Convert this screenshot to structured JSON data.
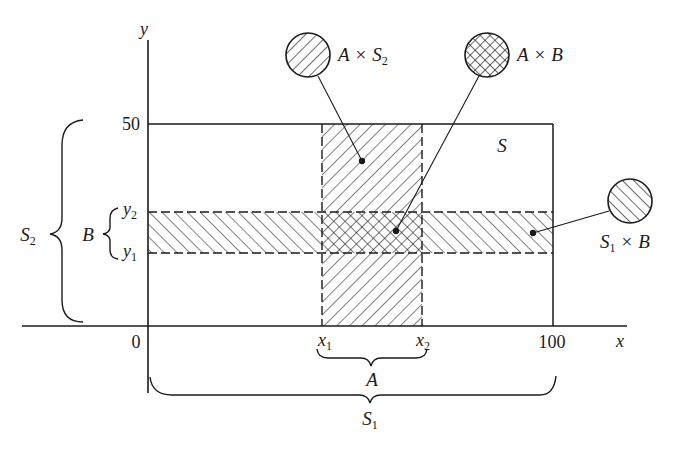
{
  "diagram": {
    "axes": {
      "x_label": "x",
      "y_label": "y",
      "origin_label": "0",
      "x_max_label": "100",
      "y_max_label": "50"
    },
    "region_S": {
      "label": "S"
    },
    "ticks": {
      "x1": {
        "base": "x",
        "sub": "1"
      },
      "x2": {
        "base": "x",
        "sub": "2"
      },
      "y1": {
        "base": "y",
        "sub": "1"
      },
      "y2": {
        "base": "y",
        "sub": "2"
      }
    },
    "braces": {
      "A": {
        "label": "A"
      },
      "S1": {
        "base": "S",
        "sub": "1"
      },
      "B": {
        "label": "B"
      },
      "S2": {
        "base": "S",
        "sub": "2"
      }
    },
    "callouts": [
      {
        "id": "A-x-S2",
        "pattern": "hatch-backslash",
        "lhs": "A",
        "op": "×",
        "rhs_base": "S",
        "rhs_sub": "2"
      },
      {
        "id": "A-x-B",
        "pattern": "crosshatch",
        "lhs": "A",
        "op": "×",
        "rhs_base": "B",
        "rhs_sub": ""
      },
      {
        "id": "S1-x-B",
        "pattern": "hatch-slash",
        "lhs_base": "S",
        "lhs_sub": "1",
        "op": "×",
        "rhs_base": "B",
        "rhs_sub": ""
      }
    ],
    "colors": {
      "ink": "#1a1a1a",
      "background": "#ffffff"
    }
  }
}
